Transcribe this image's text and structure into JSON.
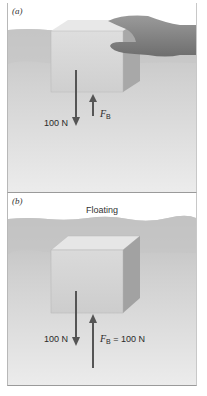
{
  "panels": [
    {
      "id": "a",
      "label": "(a)",
      "caption": "",
      "weight_label": "100 N",
      "buoyant_symbol": "F",
      "buoyant_subscript": "B",
      "buoyant_value": "",
      "state": "submerged, held down by hand"
    },
    {
      "id": "b",
      "label": "(b)",
      "caption": "Floating",
      "weight_label": "100 N",
      "buoyant_symbol": "F",
      "buoyant_subscript": "B",
      "buoyant_value": " = 100 N",
      "state": "floating"
    }
  ],
  "colors": {
    "water_surface": "#c4c4c4",
    "water_deep": "#d9d9d9",
    "water_bottom": "#ececec",
    "block_front": "#d4d4d4",
    "block_top": "#e6e6e6",
    "block_side": "#a9a9a9",
    "arrow": "#555555",
    "hand": "#8a8a8a"
  }
}
